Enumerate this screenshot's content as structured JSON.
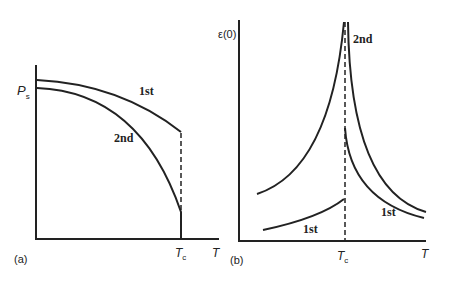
{
  "panel_a": {
    "tag": "(a)",
    "y_label": "P",
    "y_label_sub": "s",
    "x_label": "T",
    "tc_label": "T",
    "tc_sub": "c",
    "curve_1st": "1st",
    "curve_2nd": "2nd"
  },
  "panel_b": {
    "tag": "(b)",
    "y_label": "ε(0)",
    "x_label": "T",
    "tc_label": "T",
    "tc_sub": "c",
    "curve_2nd": "2nd",
    "curve_1st_right": "1st",
    "curve_1st_left": "1st"
  }
}
